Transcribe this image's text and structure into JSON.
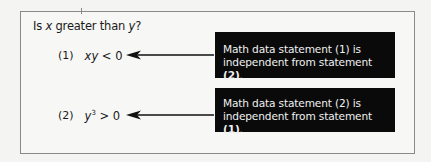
{
  "question": {
    "prefix": "Is ",
    "var_x": "x",
    "middle": " greater than ",
    "var_y": "y",
    "suffix": "?"
  },
  "statements": [
    {
      "number": "(1)",
      "expr_vars": "xy",
      "expr_rest": " < 0",
      "note_text": "Math data statement (1) is independent from statement ",
      "note_ref": "(2)",
      "note_end": "."
    },
    {
      "number": "(2)",
      "expr_vars": "y",
      "expr_sup": "3",
      "expr_rest": " > 0",
      "note_text": "Math data statement (2) is independent from statement ",
      "note_ref": "(1)",
      "note_end": "."
    }
  ],
  "colors": {
    "note_bg": "#0a0a0a",
    "note_text": "#f0f0f0",
    "frame_border": "#8a8a8a",
    "page_bg": "#f4f4f2"
  }
}
